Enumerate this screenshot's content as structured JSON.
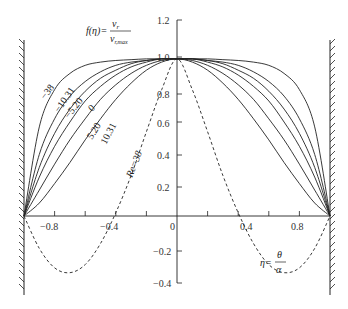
{
  "chart_data": {
    "type": "line",
    "title": "",
    "formula_label": {
      "lhs": "f(η)=",
      "numerator": "v_r",
      "denominator": "v_r,max"
    },
    "xlabel": {
      "lhs": "η=",
      "numerator": "θ",
      "denominator": "α"
    },
    "ylabel": "f(η) = v_r / v_r,max",
    "xlim": [
      -1.0,
      1.0
    ],
    "ylim": [
      -0.4,
      1.2
    ],
    "x_ticks": [
      -0.8,
      -0.6,
      -0.4,
      -0.2,
      0,
      0.2,
      0.4,
      0.6,
      0.8
    ],
    "x_tick_labels": [
      "-0.8",
      "-0.4",
      "0",
      "0.4",
      "0.8"
    ],
    "y_ticks": [
      1.2,
      1.0,
      0.8,
      0.6,
      0.4,
      0.2,
      0,
      -0.2,
      -0.4
    ],
    "y_tick_labels": [
      "1.2",
      "1.0",
      "0.8",
      "0.6",
      "0.4",
      "0.2",
      "0",
      "-0.2",
      "-0.4"
    ],
    "grid": false,
    "walls": [
      -1.0,
      1.0
    ],
    "x": [
      -1.0,
      -0.9,
      -0.8,
      -0.7,
      -0.6,
      -0.5,
      -0.4,
      -0.3,
      -0.2,
      -0.1,
      0.0,
      0.1,
      0.2,
      0.3,
      0.4,
      0.5,
      0.6,
      0.7,
      0.8,
      0.9,
      1.0
    ],
    "series": [
      {
        "name": "-38",
        "style": "solid",
        "values": [
          0.0,
          0.55,
          0.78,
          0.88,
          0.93,
          0.95,
          0.96,
          0.965,
          0.97,
          0.97,
          0.97,
          0.97,
          0.97,
          0.965,
          0.96,
          0.95,
          0.93,
          0.88,
          0.78,
          0.55,
          0.0
        ]
      },
      {
        "name": "-10.31",
        "style": "solid",
        "values": [
          0.0,
          0.38,
          0.6,
          0.74,
          0.83,
          0.89,
          0.93,
          0.95,
          0.96,
          0.97,
          0.97,
          0.97,
          0.96,
          0.95,
          0.93,
          0.89,
          0.83,
          0.74,
          0.6,
          0.38,
          0.0
        ]
      },
      {
        "name": "-5.20",
        "style": "solid",
        "values": [
          0.0,
          0.3,
          0.51,
          0.66,
          0.77,
          0.85,
          0.9,
          0.94,
          0.96,
          0.97,
          0.97,
          0.97,
          0.96,
          0.94,
          0.9,
          0.85,
          0.77,
          0.66,
          0.51,
          0.3,
          0.0
        ]
      },
      {
        "name": "0",
        "style": "solid",
        "values": [
          0.0,
          0.24,
          0.43,
          0.58,
          0.71,
          0.8,
          0.87,
          0.92,
          0.95,
          0.97,
          0.97,
          0.97,
          0.95,
          0.92,
          0.87,
          0.8,
          0.71,
          0.58,
          0.43,
          0.24,
          0.0
        ]
      },
      {
        "name": "5.20",
        "style": "solid",
        "values": [
          0.0,
          0.16,
          0.32,
          0.47,
          0.6,
          0.72,
          0.81,
          0.88,
          0.93,
          0.96,
          0.97,
          0.96,
          0.93,
          0.88,
          0.81,
          0.72,
          0.6,
          0.47,
          0.32,
          0.16,
          0.0
        ]
      },
      {
        "name": "10.31",
        "style": "solid",
        "values": [
          0.0,
          0.08,
          0.2,
          0.33,
          0.47,
          0.6,
          0.72,
          0.82,
          0.9,
          0.95,
          0.97,
          0.95,
          0.9,
          0.82,
          0.72,
          0.6,
          0.47,
          0.33,
          0.2,
          0.08,
          0.0
        ]
      },
      {
        "name": "Re=38",
        "style": "dashed",
        "values": [
          0.0,
          -0.2,
          -0.32,
          -0.35,
          -0.3,
          -0.17,
          0.02,
          0.25,
          0.52,
          0.78,
          0.97,
          0.78,
          0.52,
          0.25,
          0.02,
          -0.17,
          -0.3,
          -0.35,
          -0.32,
          -0.2,
          0.0
        ]
      }
    ],
    "annotations": [
      {
        "text": "-38",
        "x": -0.82,
        "y": 0.72
      },
      {
        "text": "-10.31",
        "x": -0.67,
        "y": 0.64
      },
      {
        "text": "-5.20",
        "x": -0.55,
        "y": 0.58
      },
      {
        "text": "0",
        "x": -0.43,
        "y": 0.58
      },
      {
        "text": "5.20",
        "x": -0.4,
        "y": 0.4
      },
      {
        "text": "10.31",
        "x": -0.26,
        "y": 0.36
      },
      {
        "text": "Re=38",
        "x": -0.32,
        "y": 0.28
      }
    ]
  },
  "labels": {
    "formula_lhs": "f(η)=",
    "formula_num": "v",
    "formula_num_sub": "r",
    "formula_den": "v",
    "formula_den_sub": "r,max",
    "xlabel_lhs": "η=",
    "xlabel_num": "θ",
    "xlabel_den": "α",
    "curve_m38": "−38",
    "curve_m1031": "−10.31",
    "curve_m520": "−5.20",
    "curve_0": "0",
    "curve_520": "5.20",
    "curve_1031": "10.31",
    "curve_re38": "Re=38",
    "tick_x_m08": "−0.8",
    "tick_x_m04": "−0.4",
    "tick_x_0": "0",
    "tick_x_04": "0.4",
    "tick_x_08": "0.8",
    "tick_y_12": "1.2",
    "tick_y_10": "1.0",
    "tick_y_08": "0.8",
    "tick_y_06": "0.6",
    "tick_y_04": "0.4",
    "tick_y_02": "0.2",
    "tick_y_m02": "−0.2",
    "tick_y_m04": "−0.4"
  }
}
